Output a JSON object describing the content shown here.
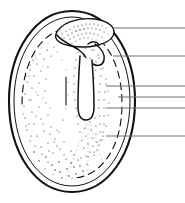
{
  "figure": {
    "style": "stippled ink line drawing",
    "width": 185,
    "height": 203,
    "background_color": "#ffffff",
    "ink_color": "#111111",
    "leader_line_color": "#6e6e6e",
    "label_text": ""
  },
  "structures": [
    {
      "name": "seed-coat-outer",
      "description": "thick black outer oval outline (testa)",
      "stroke_color": "#111111",
      "stroke_width": 2.1
    },
    {
      "name": "seed-coat-inner",
      "description": "thin inner oval line parallel to outer testa",
      "stroke_color": "#111111",
      "stroke_width": 1.0
    },
    {
      "name": "endosperm-boundary",
      "description": "dashed arc marking inner endosperm limit",
      "stroke_color": "#111111",
      "stroke_width": 1.1,
      "dash": "7 5"
    },
    {
      "name": "cotyledon-lobe",
      "description": "upper curved lobe with dense stipple",
      "stroke_color": "#111111",
      "stroke_width": 1.4
    },
    {
      "name": "embryo-axis",
      "description": "S-curved embryo running from top lobe downward",
      "stroke_color": "#111111",
      "stroke_width": 1.5
    },
    {
      "name": "radicle-channel",
      "description": "narrow U-shaped vertical radicle / hypocotyl channel",
      "stroke_color": "#111111",
      "stroke_width": 1.5
    },
    {
      "name": "stipple-shading",
      "description": "dotted stipple texture filling endosperm region",
      "fill_color": "#1b1b1b"
    }
  ],
  "leader_lines": [
    {
      "id": "leader-1",
      "y": 28,
      "x_start": 113,
      "x_end": 185,
      "label": ""
    },
    {
      "id": "leader-2",
      "y": 56,
      "x_start": 113,
      "x_end": 185,
      "label": ""
    },
    {
      "id": "leader-3",
      "y": 86,
      "x_start": 106,
      "x_end": 185,
      "label": ""
    },
    {
      "id": "leader-4",
      "y": 97,
      "x_start": 118,
      "x_end": 185,
      "label": ""
    },
    {
      "id": "leader-5",
      "y": 108,
      "x_start": 106,
      "x_end": 185,
      "label": ""
    },
    {
      "id": "leader-6",
      "y": 136,
      "x_start": 106,
      "x_end": 185,
      "label": ""
    }
  ]
}
